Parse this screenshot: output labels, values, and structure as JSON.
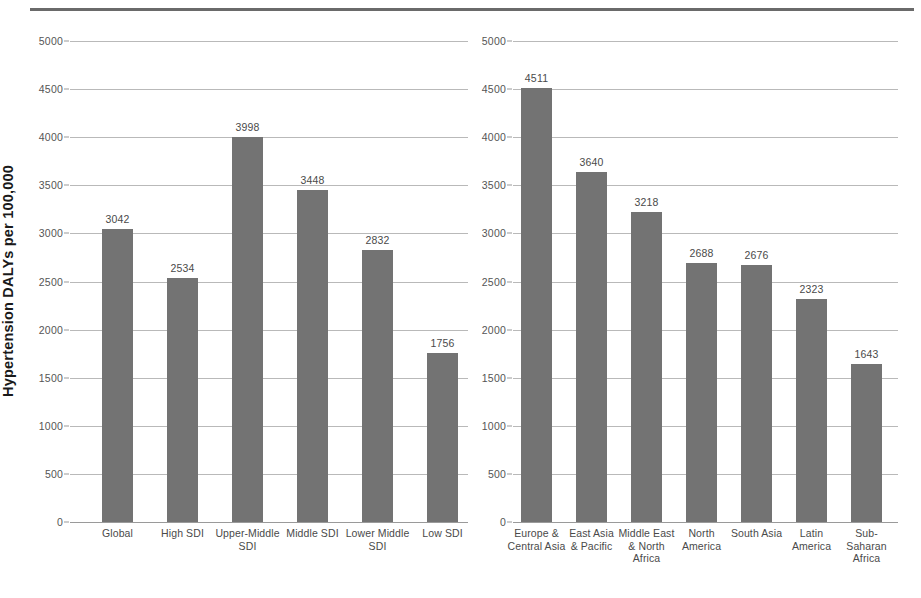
{
  "figure": {
    "y_axis_title": "Hypertension DALYs per 100,000",
    "bar_color": "#737373",
    "gridline_color": "#b9b9b9",
    "rule_color": "#6a6a6a"
  },
  "chart_data": [
    {
      "type": "bar",
      "panel": "left",
      "title": "",
      "xlabel": "",
      "ylabel": "Hypertension DALYs per 100,000",
      "ylim": [
        0,
        5000
      ],
      "yticks": [
        0,
        500,
        1000,
        1500,
        2000,
        2500,
        3000,
        3500,
        4000,
        4500,
        5000
      ],
      "ytick_labels": [
        "0",
        "500",
        "1000",
        "1500",
        "2000",
        "2500",
        "3000",
        "3500",
        "4000",
        "4500",
        "5000"
      ],
      "grid": true,
      "legend": "none",
      "categories": [
        "Global",
        "High SDI",
        "Upper-Middle\nSDI",
        "Middle SDI",
        "Lower Middle\nSDI",
        "Low SDI"
      ],
      "values": [
        3042,
        2534,
        3998,
        3448,
        2832,
        1756
      ],
      "value_labels": [
        "3042",
        "2534",
        "3998",
        "3448",
        "2832",
        "1756"
      ]
    },
    {
      "type": "bar",
      "panel": "right",
      "title": "",
      "xlabel": "",
      "ylabel": "",
      "ylim": [
        0,
        5000
      ],
      "yticks": [
        0,
        500,
        1000,
        1500,
        2000,
        2500,
        3000,
        3500,
        4000,
        4500,
        5000
      ],
      "ytick_labels": [
        "0",
        "500",
        "1000",
        "1500",
        "2000",
        "2500",
        "3000",
        "3500",
        "4000",
        "4500",
        "5000"
      ],
      "grid": true,
      "legend": "none",
      "categories": [
        "Europe &\nCentral Asia",
        "East Asia\n& Pacific",
        "Middle East\n& North\nAfrica",
        "North\nAmerica",
        "South Asia",
        "Latin\nAmerica",
        "Sub-Saharan\nAfrica"
      ],
      "values": [
        4511,
        3640,
        3218,
        2688,
        2676,
        2323,
        1643
      ],
      "value_labels": [
        "4511",
        "3640",
        "3218",
        "2688",
        "2676",
        "2323",
        "1643"
      ]
    }
  ]
}
